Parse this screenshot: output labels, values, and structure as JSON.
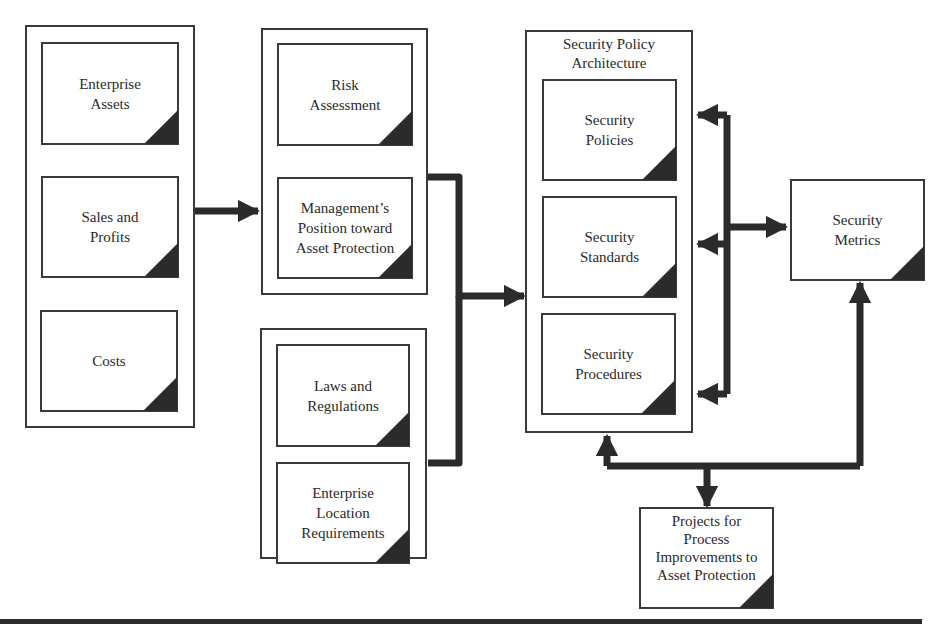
{
  "diagram": {
    "type": "flowchart",
    "groups": [
      {
        "id": "inputs_left",
        "nodes": [
          "Enterprise\nAssets",
          "Sales and\nProfits",
          "Costs"
        ]
      },
      {
        "id": "assessment",
        "nodes": [
          "Risk\nAssessment",
          "Management’s\nPosition toward\nAsset Protection"
        ]
      },
      {
        "id": "regulatory",
        "nodes": [
          "Laws and\nRegulations",
          "Enterprise\nLocation\nRequirements"
        ]
      },
      {
        "id": "policy_arch",
        "title": "Security Policy\nArchitecture",
        "nodes": [
          "Security\nPolicies",
          "Security\nStandards",
          "Security\nProcedures"
        ]
      }
    ],
    "standalone_nodes": {
      "metrics": "Security\nMetrics",
      "projects": "Projects for\nProcess\nImprovements to\nAsset Protection"
    },
    "edges": [
      {
        "from": "inputs_left",
        "to": "assessment",
        "directed": true
      },
      {
        "from": "assessment",
        "to": "policy_arch",
        "directed": true
      },
      {
        "from": "regulatory",
        "to": "policy_arch",
        "directed": true
      },
      {
        "from": "policy_arch",
        "to": "metrics",
        "bidirectional": true
      },
      {
        "from": "policy_arch",
        "to": "projects",
        "bidirectional": true
      },
      {
        "from": "metrics",
        "to": "projects",
        "bidirectional": true
      }
    ],
    "colors": {
      "stroke": "#2b2b2b",
      "box_border": "#3a3a3a",
      "background": "#ffffff"
    }
  }
}
